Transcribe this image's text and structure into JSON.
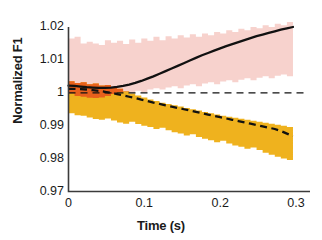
{
  "chart_data": {
    "type": "area",
    "title": "",
    "xlabel": "Time (s)",
    "ylabel": "Normalized F1",
    "xlim": [
      0,
      0.3
    ],
    "ylim": [
      0.97,
      1.02
    ],
    "xticks": [
      0,
      0.1,
      0.2,
      0.3
    ],
    "xtick_labels": [
      "0",
      "0.1",
      "0.2",
      "0.3"
    ],
    "yticks": [
      0.97,
      0.98,
      0.99,
      1,
      1.01,
      1.02
    ],
    "ytick_labels": [
      "0.97",
      "0.98",
      "0.99",
      "1",
      "1.01",
      "1.02"
    ],
    "grid": false,
    "legend": "none",
    "reference_line": {
      "type": "horizontal-dashed",
      "y": 1.0,
      "color": "#111111"
    },
    "series": [
      {
        "name": "rising-series",
        "style": "solid",
        "line_color": "#111111",
        "band_color": "#F7D2CD",
        "x": [
          0.0,
          0.008,
          0.016,
          0.024,
          0.032,
          0.04,
          0.048,
          0.056,
          0.064,
          0.072,
          0.08,
          0.088,
          0.096,
          0.104,
          0.112,
          0.12,
          0.128,
          0.136,
          0.144,
          0.152,
          0.16,
          0.168,
          0.176,
          0.184,
          0.192,
          0.2,
          0.208,
          0.216,
          0.224,
          0.232,
          0.24,
          0.248,
          0.256,
          0.264,
          0.272,
          0.28,
          0.288,
          0.296
        ],
        "mean": [
          1.0022,
          1.0021,
          1.0019,
          1.0017,
          1.0016,
          1.0015,
          1.0015,
          1.0016,
          1.0018,
          1.0021,
          1.0025,
          1.003,
          1.0036,
          1.0043,
          1.005,
          1.0058,
          1.0066,
          1.0074,
          1.0082,
          1.009,
          1.0098,
          1.0106,
          1.0114,
          1.0121,
          1.0128,
          1.0135,
          1.0142,
          1.0148,
          1.0154,
          1.016,
          1.0166,
          1.0172,
          1.0177,
          1.0182,
          1.0187,
          1.0192,
          1.0196,
          1.02
        ],
        "upper": [
          1.0165,
          1.017,
          1.015,
          1.0155,
          1.015,
          1.0145,
          1.016,
          1.0152,
          1.0158,
          1.0148,
          1.0162,
          1.0152,
          1.0165,
          1.0158,
          1.017,
          1.016,
          1.0172,
          1.0165,
          1.0175,
          1.0168,
          1.0178,
          1.017,
          1.018,
          1.0175,
          1.0185,
          1.018,
          1.019,
          1.0185,
          1.0195,
          1.019,
          1.02,
          1.0196,
          1.0205,
          1.02,
          1.021,
          1.0205,
          1.0215,
          1.021
        ],
        "lower": [
          1.0,
          0.9998,
          0.999,
          0.9988,
          0.9985,
          0.9984,
          0.9986,
          0.999,
          0.9996,
          1.0002,
          1.0004,
          1.0,
          1.0006,
          1.0002,
          1.001,
          1.0014,
          1.001,
          1.0016,
          1.002,
          1.0014,
          1.0022,
          1.0026,
          1.002,
          1.0028,
          1.0032,
          1.0026,
          1.0034,
          1.0038,
          1.0032,
          1.004,
          1.0044,
          1.0038,
          1.0046,
          1.005,
          1.0044,
          1.0052,
          1.0056,
          1.005
        ]
      },
      {
        "name": "falling-series",
        "style": "dashed",
        "line_color": "#111111",
        "band_color": "#EFB21E",
        "x": [
          0.0,
          0.008,
          0.016,
          0.024,
          0.032,
          0.04,
          0.048,
          0.056,
          0.064,
          0.072,
          0.08,
          0.088,
          0.096,
          0.104,
          0.112,
          0.12,
          0.128,
          0.136,
          0.144,
          0.152,
          0.16,
          0.168,
          0.176,
          0.184,
          0.192,
          0.2,
          0.208,
          0.216,
          0.224,
          0.232,
          0.24,
          0.248,
          0.256,
          0.264,
          0.272,
          0.28,
          0.288,
          0.296
        ],
        "mean": [
          1.0012,
          1.0012,
          1.0011,
          1.001,
          1.0008,
          1.0006,
          1.0003,
          1.0,
          0.9996,
          0.9992,
          0.9988,
          0.9984,
          0.9979,
          0.9975,
          0.997,
          0.9966,
          0.9962,
          0.9958,
          0.9954,
          0.995,
          0.9946,
          0.9942,
          0.9938,
          0.9934,
          0.993,
          0.9926,
          0.9922,
          0.9918,
          0.9914,
          0.991,
          0.9906,
          0.9902,
          0.9898,
          0.9894,
          0.989,
          0.9884,
          0.9876,
          0.9868
        ],
        "upper": [
          1.0035,
          1.003,
          1.0032,
          1.0026,
          1.0028,
          1.0022,
          1.0024,
          1.0018,
          1.0012,
          1.0005,
          0.9998,
          0.9992,
          0.9986,
          0.998,
          0.9975,
          0.997,
          0.9966,
          0.9962,
          0.9958,
          0.9954,
          0.995,
          0.9946,
          0.9942,
          0.9938,
          0.9934,
          0.993,
          0.9927,
          0.9924,
          0.9921,
          0.9918,
          0.9915,
          0.9912,
          0.9909,
          0.9906,
          0.9903,
          0.99,
          0.9896,
          0.9892
        ],
        "lower": [
          0.9942,
          0.9938,
          0.9932,
          0.993,
          0.9925,
          0.992,
          0.9918,
          0.9922,
          0.9916,
          0.991,
          0.9906,
          0.9912,
          0.9905,
          0.99,
          0.9896,
          0.989,
          0.9894,
          0.9886,
          0.988,
          0.9876,
          0.987,
          0.9874,
          0.9866,
          0.986,
          0.9856,
          0.985,
          0.9854,
          0.9846,
          0.984,
          0.9836,
          0.983,
          0.9834,
          0.9826,
          0.9818,
          0.9812,
          0.9806,
          0.98,
          0.9796
        ]
      }
    ],
    "colors": {
      "band_rising": "#F7D2CD",
      "band_falling": "#EFB21E",
      "band_overlap": "#E8601C",
      "line": "#111111",
      "axis": "#3b3b3b",
      "text": "#1a1a1a"
    }
  }
}
